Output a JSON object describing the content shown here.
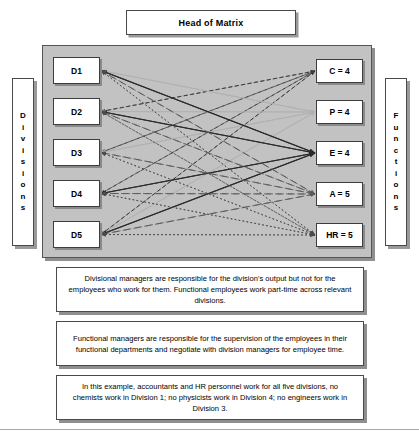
{
  "head": {
    "label": "Head of Matrix"
  },
  "side_labels": {
    "left": {
      "name": "Divisions",
      "letters": [
        "D",
        "i",
        "v",
        "i",
        "s",
        "i",
        "o",
        "n",
        "s"
      ]
    },
    "right": {
      "name": "Functions",
      "letters": [
        "F",
        "u",
        "n",
        "c",
        "t",
        "i",
        "o",
        "n",
        "s"
      ]
    }
  },
  "divisions": [
    {
      "id": "D1",
      "label": "D1"
    },
    {
      "id": "D2",
      "label": "D2"
    },
    {
      "id": "D3",
      "label": "D3"
    },
    {
      "id": "D4",
      "label": "D4"
    },
    {
      "id": "D5",
      "label": "D5"
    }
  ],
  "functions": [
    {
      "id": "C",
      "label": "C = 4",
      "count": 4,
      "style": "dashed-short",
      "color": "#3a3a3a"
    },
    {
      "id": "P",
      "label": "P = 4",
      "count": 4,
      "style": "solid-light",
      "color": "#b0b0b0"
    },
    {
      "id": "E",
      "label": "E = 4",
      "count": 4,
      "style": "solid-dark",
      "color": "#2b2b2b"
    },
    {
      "id": "A",
      "label": "A = 5",
      "count": 5,
      "style": "dashed-long",
      "color": "#5a5a5a"
    },
    {
      "id": "HR",
      "label": "HR = 5",
      "count": 5,
      "style": "dotted",
      "color": "#4a4a4a"
    }
  ],
  "links": [
    {
      "from": "C",
      "to": [
        "D2",
        "D3",
        "D4",
        "D5"
      ]
    },
    {
      "from": "P",
      "to": [
        "D1",
        "D2",
        "D3",
        "D5"
      ]
    },
    {
      "from": "E",
      "to": [
        "D1",
        "D2",
        "D4",
        "D5"
      ]
    },
    {
      "from": "A",
      "to": [
        "D1",
        "D2",
        "D3",
        "D4",
        "D5"
      ]
    },
    {
      "from": "HR",
      "to": [
        "D1",
        "D2",
        "D3",
        "D4",
        "D5"
      ]
    }
  ],
  "notes": [
    {
      "id": "note-1",
      "text": "Divisional managers are responsible for the division's output but not for the employees who work for them. Functional employees work part-time across relevant divisions."
    },
    {
      "id": "note-2",
      "text": "Functional managers are responsible for the supervision of the employees in their functional departments and negotiate with division managers for employee time."
    },
    {
      "id": "note-3",
      "text": "In this example, accountants and HR personnel work for all five divisions, no chemists work in Division 1; no physicists work in Division 4; no engineers work in Division 3."
    }
  ],
  "colors": {
    "panel_background": "#c2c2c2",
    "box_border": "#4a4a4a",
    "shadow": "#8f8f8f",
    "text": "#000000"
  }
}
